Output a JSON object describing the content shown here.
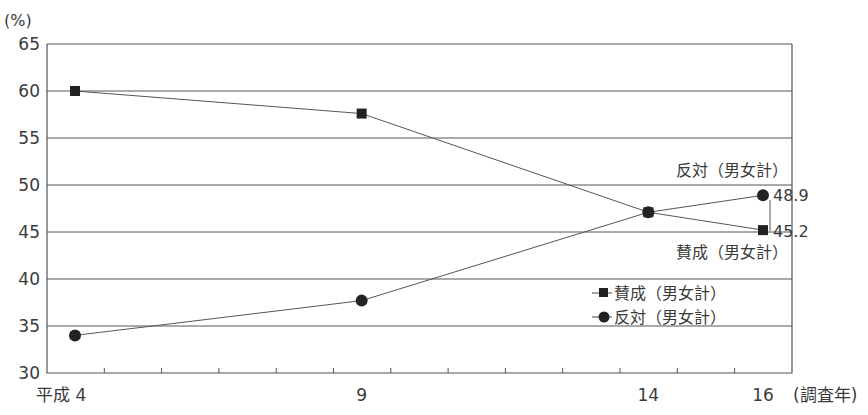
{
  "chart_data": {
    "type": "line",
    "title": "",
    "ylabel": "(%)",
    "xlabel": "(調査年)",
    "ylim": [
      30,
      65
    ],
    "yticks": [
      30,
      35,
      40,
      45,
      50,
      55,
      60,
      65
    ],
    "xlim": [
      4,
      16
    ],
    "x": [
      4,
      9,
      14,
      16
    ],
    "x_tick_labels": [
      {
        "x": 4,
        "label": "平成 4"
      },
      {
        "x": 9,
        "label": "9"
      },
      {
        "x": 14,
        "label": "14"
      },
      {
        "x": 16,
        "label": "16"
      }
    ],
    "grid": true,
    "series": [
      {
        "name": "賛成（男女計）",
        "marker": "square",
        "values": [
          60.0,
          57.6,
          47.1,
          45.2
        ]
      },
      {
        "name": "反対（男女計）",
        "marker": "circle",
        "values": [
          34.0,
          37.7,
          47.1,
          48.9
        ]
      }
    ],
    "annotations": [
      {
        "text": "反対（男女計）",
        "series": 1
      },
      {
        "text": "48.9",
        "series": 1,
        "value": 48.9
      },
      {
        "text": "45.2",
        "series": 0,
        "value": 45.2
      },
      {
        "text": "賛成（男女計）",
        "series": 0
      }
    ],
    "legend": {
      "position": "inside-lower-right",
      "entries": [
        "賛成（男女計）",
        "反対（男女計）"
      ]
    }
  },
  "labels": {
    "y_unit": "(%)",
    "x_unit": "(調査年)",
    "anno_oppose": "反対（男女計）",
    "anno_agree": "賛成（男女計）",
    "val_oppose_last": "48.9",
    "val_agree_last": "45.2",
    "legend_agree": "賛成（男女計）",
    "legend_oppose": "反対（男女計）"
  }
}
